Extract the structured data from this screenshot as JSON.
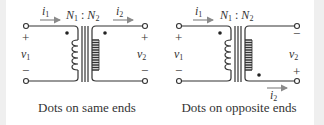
{
  "colors": {
    "wire": "#333333",
    "arrow": "#8a8a8a",
    "edge": "#efefef",
    "background": "#ffffff"
  },
  "diagrams": [
    {
      "caption": "Dots on same ends",
      "ratio": {
        "n1": "N",
        "n1_sub": "1",
        "sep": " : ",
        "n2": "N",
        "n2_sub": "2"
      },
      "i1": {
        "sym": "i",
        "sub": "1"
      },
      "i2": {
        "sym": "i",
        "sub": "2"
      },
      "v1": {
        "sym": "v",
        "sub": "1",
        "top_sign": "+",
        "bottom_sign": "−"
      },
      "v2": {
        "sym": "v",
        "sub": "2",
        "top_sign": "+",
        "bottom_sign": "−"
      },
      "secondary_dot": "top"
    },
    {
      "caption": "Dots on opposite ends",
      "ratio": {
        "n1": "N",
        "n1_sub": "1",
        "sep": " : ",
        "n2": "N",
        "n2_sub": "2"
      },
      "i1": {
        "sym": "i",
        "sub": "1"
      },
      "i2": {
        "sym": "i",
        "sub": "2"
      },
      "v1": {
        "sym": "v",
        "sub": "1",
        "top_sign": "+",
        "bottom_sign": "−"
      },
      "v2": {
        "sym": "v",
        "sub": "2",
        "top_sign": "−",
        "bottom_sign": "+"
      },
      "secondary_dot": "bottom"
    }
  ]
}
